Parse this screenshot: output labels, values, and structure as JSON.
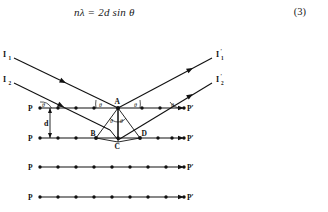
{
  "equation": {
    "text_parts": {
      "n": "n",
      "lambda": "λ",
      "equals": " = ",
      "two_d": "2d",
      "sin": " sin ",
      "theta": "θ"
    },
    "full_text": "nλ = 2d sin θ",
    "number": "(3)"
  },
  "diagram": {
    "caption_cut": "",
    "incident_rays": [
      {
        "label": "I",
        "sub": "1",
        "name": "incident-ray-1"
      },
      {
        "label": "I",
        "sub": "2",
        "name": "incident-ray-2"
      }
    ],
    "reflected_rays": [
      {
        "label": "I",
        "sub": "1",
        "prime": "′",
        "name": "reflected-ray-1"
      },
      {
        "label": "I",
        "sub": "2",
        "prime": "′",
        "name": "reflected-ray-2"
      }
    ],
    "points": {
      "A": "A",
      "B": "B",
      "C": "C",
      "D": "D"
    },
    "spacing_label": "d",
    "angles": [
      {
        "label": "θ",
        "name": "angle-theta-left-plane"
      },
      {
        "label": "θ",
        "name": "angle-theta-incident-at-A"
      },
      {
        "label": "θ",
        "name": "angle-theta-reflected-at-A"
      },
      {
        "label": "θ",
        "name": "angle-theta-right-plane"
      },
      {
        "label": "θ",
        "name": "angle-theta-triangle-apex"
      }
    ],
    "planes": [
      {
        "left_label": "P",
        "right_label": "P′",
        "atoms": 9,
        "name": "lattice-plane-1"
      },
      {
        "left_label": "P",
        "right_label": "P′",
        "atoms": 9,
        "name": "lattice-plane-2"
      },
      {
        "left_label": "P",
        "right_label": "P′",
        "atoms": 9,
        "name": "lattice-plane-3"
      },
      {
        "left_label": "P",
        "right_label": "P′",
        "atoms": 9,
        "name": "lattice-plane-4"
      }
    ],
    "colors": {
      "ink": "#111111",
      "background": "#ffffff"
    }
  }
}
